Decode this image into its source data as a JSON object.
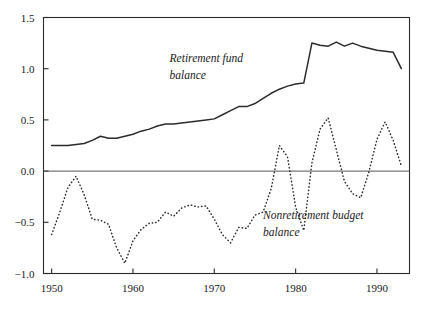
{
  "chart_data": {
    "type": "line",
    "title": "",
    "subtitle": "",
    "xlabel": "",
    "ylabel": "",
    "xlim": [
      1949,
      1994
    ],
    "ylim": [
      -1.0,
      1.5
    ],
    "grid": false,
    "legend_position": "inline-annotations",
    "x_ticks": [
      1950,
      1960,
      1970,
      1980,
      1990
    ],
    "x_tick_labels": [
      "1950",
      "1960",
      "1970",
      "1980",
      "1990"
    ],
    "y_ticks": [
      -1.0,
      -0.5,
      0.0,
      0.5,
      1.0,
      1.5
    ],
    "y_tick_labels": [
      "−1.0",
      "−0.5",
      "0.0",
      "0.5",
      "1.0",
      "1.5"
    ],
    "zero_line": 0.0,
    "annotations": [
      {
        "id": "retirement-fund-label",
        "lines": [
          "Retirement fund",
          "balance"
        ],
        "x": 1964.5,
        "y": 1.07,
        "style": "italic"
      },
      {
        "id": "nonretirement-budget-label",
        "lines": [
          "Nonretirement budget",
          "balance"
        ],
        "x": 1976.0,
        "y": -0.47,
        "style": "italic"
      }
    ],
    "series": [
      {
        "name": "Retirement fund balance",
        "style": "solid",
        "color": "#2b2b2b",
        "x": [
          1950,
          1951,
          1952,
          1953,
          1954,
          1955,
          1956,
          1957,
          1958,
          1959,
          1960,
          1961,
          1962,
          1963,
          1964,
          1965,
          1966,
          1967,
          1968,
          1969,
          1970,
          1971,
          1972,
          1973,
          1974,
          1975,
          1976,
          1977,
          1978,
          1979,
          1980,
          1981,
          1982,
          1983,
          1984,
          1985,
          1986,
          1987,
          1988,
          1989,
          1990,
          1991,
          1992,
          1993
        ],
        "values": [
          0.25,
          0.25,
          0.25,
          0.26,
          0.27,
          0.3,
          0.34,
          0.32,
          0.32,
          0.34,
          0.36,
          0.39,
          0.41,
          0.44,
          0.46,
          0.46,
          0.47,
          0.48,
          0.49,
          0.5,
          0.51,
          0.55,
          0.59,
          0.63,
          0.63,
          0.66,
          0.71,
          0.76,
          0.8,
          0.83,
          0.85,
          0.86,
          1.25,
          1.23,
          1.22,
          1.26,
          1.22,
          1.25,
          1.22,
          1.2,
          1.18,
          1.17,
          1.16,
          1.0
        ]
      },
      {
        "name": "Nonretirement budget balance",
        "style": "dotted",
        "color": "#2b2b2b",
        "x": [
          1950,
          1951,
          1952,
          1953,
          1954,
          1955,
          1956,
          1957,
          1958,
          1959,
          1960,
          1961,
          1962,
          1963,
          1964,
          1965,
          1966,
          1967,
          1968,
          1969,
          1970,
          1971,
          1972,
          1973,
          1974,
          1975,
          1976,
          1977,
          1978,
          1979,
          1980,
          1981,
          1982,
          1983,
          1984,
          1985,
          1986,
          1987,
          1988,
          1989,
          1990,
          1991,
          1992,
          1993
        ],
        "values": [
          -0.62,
          -0.4,
          -0.16,
          -0.05,
          -0.23,
          -0.47,
          -0.48,
          -0.52,
          -0.75,
          -0.9,
          -0.68,
          -0.57,
          -0.51,
          -0.5,
          -0.4,
          -0.44,
          -0.36,
          -0.33,
          -0.35,
          -0.34,
          -0.47,
          -0.62,
          -0.7,
          -0.55,
          -0.56,
          -0.43,
          -0.4,
          -0.17,
          0.25,
          0.14,
          -0.35,
          -0.58,
          0.08,
          0.41,
          0.52,
          0.21,
          -0.1,
          -0.22,
          -0.26,
          -0.01,
          0.31,
          0.48,
          0.3,
          0.05
        ]
      }
    ]
  },
  "meta": {
    "background_color": "#ffffff",
    "axis_color": "#2b2b2b",
    "zero_line_color": "#555555"
  }
}
